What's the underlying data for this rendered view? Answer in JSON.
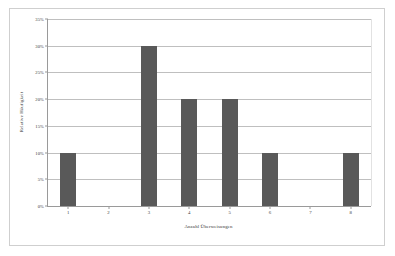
{
  "chart_data": {
    "type": "bar",
    "title": "",
    "subtitle": "",
    "xlabel": "Anzahl Überweisungen",
    "ylabel": "Relative Häufigkeit",
    "categories": [
      "1",
      "2",
      "3",
      "4",
      "5",
      "6",
      "7",
      "8"
    ],
    "values": [
      10,
      0,
      30,
      20,
      20,
      10,
      0,
      10
    ],
    "value_unit": "%",
    "series": [
      {
        "name": "Relative Häufigkeit",
        "values": [
          10,
          0,
          30,
          20,
          20,
          10,
          0,
          10
        ]
      }
    ],
    "ylim": [
      0,
      35
    ],
    "ytick_values": [
      0,
      5,
      10,
      15,
      20,
      25,
      30,
      35
    ],
    "ytick_labels": [
      "0%",
      "5%",
      "10%",
      "15%",
      "20%",
      "25%",
      "30%",
      "35%"
    ],
    "xtick_labels": [
      "1",
      "2",
      "3",
      "4",
      "5",
      "6",
      "7",
      "8"
    ],
    "grid": "horizontal",
    "legend": "none",
    "annotations": [],
    "colors": {
      "bar_fill": "#595959",
      "plot_background": "#ffffff",
      "gridline": "#bfbfbf",
      "axis_line": "#9a9a9a",
      "outer_frame": "#cfcfcf",
      "text": "#3a3a3a"
    }
  }
}
